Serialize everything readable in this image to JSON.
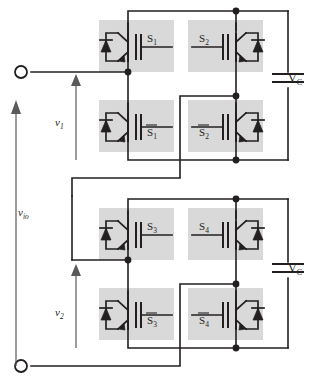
{
  "figure": {
    "type": "circuit-diagram",
    "background_color": "#ffffff",
    "line_color": "#231f20",
    "device_box_color": "#d9d9d9"
  },
  "switches": [
    {
      "id": "s1",
      "label": "S",
      "subscript": "1",
      "overbar": false,
      "cell": "upper",
      "leg": "left",
      "position": "top",
      "mirrored": false
    },
    {
      "id": "s2",
      "label": "S",
      "subscript": "2",
      "overbar": false,
      "cell": "upper",
      "leg": "right",
      "position": "top",
      "mirrored": true
    },
    {
      "id": "s1b",
      "label": "S",
      "subscript": "1",
      "overbar": true,
      "cell": "upper",
      "leg": "left",
      "position": "bottom",
      "mirrored": false
    },
    {
      "id": "s2b",
      "label": "S",
      "subscript": "2",
      "overbar": true,
      "cell": "upper",
      "leg": "right",
      "position": "bottom",
      "mirrored": true
    },
    {
      "id": "s3",
      "label": "S",
      "subscript": "3",
      "overbar": false,
      "cell": "lower",
      "leg": "left",
      "position": "top",
      "mirrored": false
    },
    {
      "id": "s4",
      "label": "S",
      "subscript": "4",
      "overbar": false,
      "cell": "lower",
      "leg": "right",
      "position": "top",
      "mirrored": true
    },
    {
      "id": "s3b",
      "label": "S",
      "subscript": "3",
      "overbar": true,
      "cell": "lower",
      "leg": "left",
      "position": "bottom",
      "mirrored": false
    },
    {
      "id": "s4b",
      "label": "S",
      "subscript": "4",
      "overbar": true,
      "cell": "lower",
      "leg": "right",
      "position": "bottom",
      "mirrored": true
    }
  ],
  "capacitors": [
    {
      "id": "c-upper",
      "label": "V",
      "subscript": "C",
      "cell": "upper"
    },
    {
      "id": "c-lower",
      "label": "V",
      "subscript": "C",
      "cell": "lower"
    }
  ],
  "voltages": [
    {
      "id": "v1",
      "label": "v",
      "subscript": "1",
      "cell": "upper",
      "direction": "up"
    },
    {
      "id": "v2",
      "label": "v",
      "subscript": "2",
      "cell": "lower",
      "direction": "up"
    },
    {
      "id": "vio",
      "label": "v",
      "subscript": "io",
      "cell": "output",
      "direction": "up"
    }
  ],
  "terminals": [
    {
      "id": "out-top",
      "name": "output-terminal-top"
    },
    {
      "id": "out-bottom",
      "name": "output-terminal-bottom"
    }
  ]
}
